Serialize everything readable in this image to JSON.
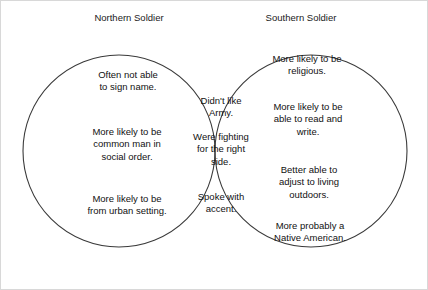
{
  "diagram": {
    "type": "venn",
    "sets": 2,
    "background_color": "#ffffff",
    "outline_color": "#3a3a3a",
    "intersection_fill": "#a6a6a6",
    "text_color": "#111111",
    "left": {
      "title": "Northern Soldier",
      "items": [
        "Often not able\nto sign name.",
        "More likely to be\ncommon man in\nsocial order.",
        "More likely to be\nfrom urban setting."
      ]
    },
    "right": {
      "title": "Southern Soldier",
      "items": [
        "More likely to be\nreligious.",
        "More likely to be\nable to read and\nwrite.",
        "Better able to\nadjust to living\noutdoors.",
        "More probably a\nNative American."
      ]
    },
    "intersection": {
      "items": [
        "Didn't like\nArmy.",
        "Were fighting\nfor the right\nside.",
        "Spoke with\naccent."
      ]
    }
  }
}
